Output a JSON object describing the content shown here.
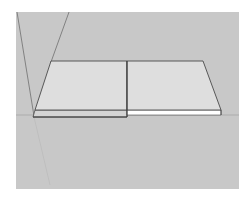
{
  "viewport": {
    "background": "#c8c8c8",
    "label": "3D modeling viewport"
  },
  "scene": {
    "slab_top_color": "#dcdcdc",
    "slab_left_side_color": "#d2d2d2",
    "slab_right_side_color": "#ffffff",
    "edge_color": "#4a4a4a",
    "guide_color": "#6e6e6e",
    "horizon_color": "#9a9a9a",
    "objects": [
      {
        "name": "left-slab",
        "type": "rectangle-face"
      },
      {
        "name": "right-slab",
        "type": "rectangle-face"
      }
    ]
  }
}
